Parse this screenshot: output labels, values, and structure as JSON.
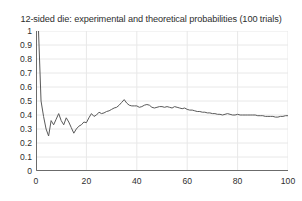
{
  "chart_data": {
    "type": "line",
    "title": "12-sided die: experimental and theoretical probabilities (100 trials)",
    "xlabel": "",
    "ylabel": "",
    "xlim": [
      0,
      100
    ],
    "ylim": [
      0,
      1
    ],
    "grid": true,
    "legend": "none",
    "x_ticks": [
      0,
      20,
      40,
      60,
      80,
      100
    ],
    "x_tick_labels": [
      "0",
      "20",
      "40",
      "60",
      "80",
      "100"
    ],
    "y_ticks": [
      0,
      0.1,
      0.2,
      0.3,
      0.4,
      0.5,
      0.6,
      0.7,
      0.8,
      0.9,
      1
    ],
    "y_tick_labels": [
      "0",
      "0.1",
      "0.2",
      "0.3",
      "0.4",
      "0.5",
      "0.6",
      "0.7",
      "0.8",
      "0.9",
      "1"
    ],
    "line_color": "#5a5a5a",
    "background_color": "#ffffff",
    "grid_color": "#e8e8e8",
    "axis_color": "#6b6b6b",
    "series": [
      {
        "name": "experimental probability",
        "x": [
          1,
          2,
          3,
          4,
          5,
          6,
          7,
          8,
          9,
          10,
          11,
          12,
          13,
          14,
          15,
          16,
          17,
          18,
          19,
          20,
          21,
          22,
          23,
          24,
          25,
          26,
          27,
          28,
          29,
          30,
          31,
          32,
          33,
          34,
          35,
          36,
          37,
          38,
          39,
          40,
          41,
          42,
          43,
          44,
          45,
          46,
          47,
          48,
          49,
          50,
          51,
          52,
          53,
          54,
          55,
          56,
          57,
          58,
          59,
          60,
          61,
          62,
          63,
          64,
          65,
          66,
          67,
          68,
          69,
          70,
          71,
          72,
          73,
          74,
          75,
          76,
          77,
          78,
          79,
          80,
          81,
          82,
          83,
          84,
          85,
          86,
          87,
          88,
          89,
          90,
          91,
          92,
          93,
          94,
          95,
          96,
          97,
          98,
          99,
          100
        ],
        "values": [
          1.0,
          0.5,
          0.39,
          0.3,
          0.25,
          0.36,
          0.33,
          0.37,
          0.41,
          0.36,
          0.33,
          0.38,
          0.35,
          0.31,
          0.27,
          0.3,
          0.32,
          0.33,
          0.35,
          0.345,
          0.38,
          0.41,
          0.39,
          0.4,
          0.42,
          0.41,
          0.415,
          0.425,
          0.43,
          0.44,
          0.45,
          0.455,
          0.47,
          0.49,
          0.51,
          0.485,
          0.47,
          0.465,
          0.465,
          0.465,
          0.455,
          0.46,
          0.47,
          0.475,
          0.47,
          0.455,
          0.45,
          0.455,
          0.46,
          0.46,
          0.455,
          0.46,
          0.455,
          0.45,
          0.46,
          0.455,
          0.45,
          0.445,
          0.45,
          0.44,
          0.435,
          0.435,
          0.43,
          0.425,
          0.425,
          0.42,
          0.42,
          0.415,
          0.415,
          0.41,
          0.41,
          0.405,
          0.405,
          0.4,
          0.405,
          0.41,
          0.405,
          0.4,
          0.4,
          0.405,
          0.4,
          0.4,
          0.4,
          0.4,
          0.4,
          0.4,
          0.4,
          0.395,
          0.395,
          0.395,
          0.39,
          0.39,
          0.39,
          0.39,
          0.385,
          0.385,
          0.39,
          0.39,
          0.395,
          0.395
        ]
      }
    ]
  }
}
